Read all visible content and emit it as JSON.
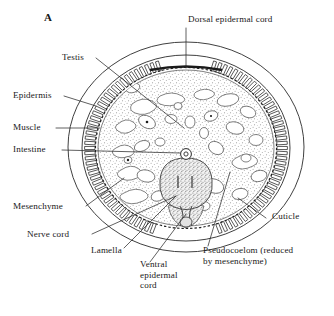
{
  "figure": {
    "panel_label": "A",
    "background_color": "#ffffff",
    "ink_color": "#1a1a1a",
    "stipple_color": "#8d8d8d"
  },
  "labels": [
    {
      "id": "panel",
      "text": "A",
      "x": 44,
      "y": 12,
      "align": "left"
    },
    {
      "id": "dorsal-epidermal-cord",
      "text": "Dorsal epidermal cord",
      "x": 188,
      "y": 18,
      "align": "left"
    },
    {
      "id": "testis",
      "text": "Testis",
      "x": 62,
      "y": 55,
      "align": "left"
    },
    {
      "id": "epidermis",
      "text": "Epidermis",
      "x": 14,
      "y": 92,
      "align": "left"
    },
    {
      "id": "muscle",
      "text": "Muscle",
      "x": 14,
      "y": 124,
      "align": "left"
    },
    {
      "id": "intestine",
      "text": "Intestine",
      "x": 14,
      "y": 146,
      "align": "left"
    },
    {
      "id": "mesenchyme",
      "text": "Mesenchyme",
      "x": 14,
      "y": 208,
      "align": "left"
    },
    {
      "id": "nerve-cord",
      "text": "Nerve cord",
      "x": 28,
      "y": 237,
      "align": "left"
    },
    {
      "id": "lamella",
      "text": "Lamella",
      "x": 92,
      "y": 252,
      "align": "left"
    },
    {
      "id": "cuticle",
      "text": "Cuticle",
      "x": 272,
      "y": 215,
      "align": "left"
    },
    {
      "id": "pseudocoelom",
      "text": "Pseudocoelom (reduced\nby mesenchyme)",
      "x": 203,
      "y": 250,
      "align": "left"
    },
    {
      "id": "ventral-epidermal-cord",
      "text": "Ventral\nepidermal\ncord",
      "x": 140,
      "y": 265,
      "align": "left"
    }
  ],
  "anatomy_parts": [
    "cuticle",
    "epidermis",
    "muscle",
    "dorsal epidermal cord",
    "ventral epidermal cord",
    "testis",
    "intestine",
    "lamella",
    "nerve cord",
    "mesenchyme",
    "pseudocoelom"
  ]
}
